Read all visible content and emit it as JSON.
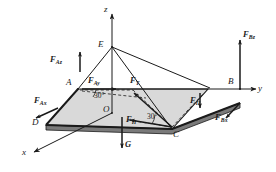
{
  "figure": {
    "kind": "statics-free-body-diagram",
    "canvas": {
      "width": 276,
      "height": 172
    },
    "background_color": "#ffffff",
    "line_color": "#1a1a1a",
    "plate_fill": "#d9d9d9",
    "plate_edge_fill": "#7a7a7a"
  },
  "axes": [
    {
      "id": "z",
      "label": "z",
      "direction": "up"
    },
    {
      "id": "y",
      "label": "y",
      "direction": "right"
    },
    {
      "id": "x",
      "label": "x",
      "direction": "down-left"
    }
  ],
  "points": [
    {
      "id": "A",
      "label": "A"
    },
    {
      "id": "B",
      "label": "B"
    },
    {
      "id": "C",
      "label": "C"
    },
    {
      "id": "D",
      "label": "D"
    },
    {
      "id": "E",
      "label": "E"
    },
    {
      "id": "O",
      "label": "O"
    }
  ],
  "forces": [
    {
      "id": "F_Az",
      "base": "F",
      "sub": "Az",
      "at": "A",
      "direction": "up-along-z"
    },
    {
      "id": "F_Ax",
      "base": "F",
      "sub": "Ax",
      "at": "A",
      "direction": "down-left-along-x"
    },
    {
      "id": "F_Ay",
      "base": "F",
      "sub": "Ay",
      "at": "A",
      "direction": "right-along-y"
    },
    {
      "id": "F_T",
      "base": "F",
      "sub": "T",
      "at": "C",
      "direction": "up-left-to-E"
    },
    {
      "id": "F_P1",
      "base": "F",
      "sub": "П",
      "at": "C",
      "direction": "left-in-plane"
    },
    {
      "id": "F_P2",
      "base": "F",
      "sub": "П",
      "at": "C",
      "direction": "down-in-plane"
    },
    {
      "id": "F_Bz",
      "base": "F",
      "sub": "Bz",
      "at": "B",
      "direction": "up-along-z"
    },
    {
      "id": "F_Bx",
      "base": "F",
      "sub": "Bx",
      "at": "B",
      "direction": "down-left-along-x"
    },
    {
      "id": "G",
      "base": "G",
      "sub": "",
      "at": "O",
      "direction": "down"
    }
  ],
  "angles": [
    {
      "id": "angle-at-A",
      "label": "30°",
      "value": 30,
      "unit": "degrees",
      "vertex": "A"
    },
    {
      "id": "angle-at-C",
      "label": "30°",
      "value": 30,
      "unit": "degrees",
      "vertex": "C"
    }
  ],
  "labels": {
    "axis_z": "z",
    "axis_y": "y",
    "axis_x": "x",
    "point_A": "A",
    "point_B": "B",
    "point_C": "C",
    "point_D": "D",
    "point_E": "E",
    "point_O": "O",
    "force_F": "F",
    "sub_Az": "Az",
    "sub_Ax": "Ax",
    "sub_Ay": "Ay",
    "sub_T": "T",
    "sub_P": "П",
    "sub_Bz": "Bz",
    "sub_Bx": "Bx",
    "weight_G": "G",
    "angle_1": "30°",
    "angle_2": "30°"
  }
}
